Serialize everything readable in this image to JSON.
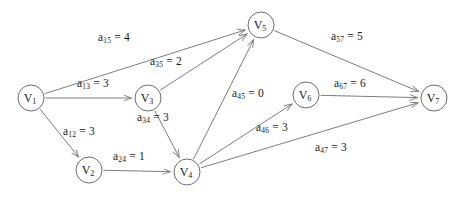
{
  "figure": {
    "background_color": "#ffffff",
    "edge_color": "#7d7d7d",
    "node_stroke_color": "#6e6e6e",
    "node_fill_color": "#ffffff",
    "text_color": "#1a1a1a"
  },
  "chart_data": {
    "type": "diagram",
    "diagram_kind": "directed-weighted-graph",
    "nodes": [
      {
        "id": "V1",
        "label_base": "V",
        "label_sub": "1",
        "x": 31,
        "y": 98,
        "r": 13
      },
      {
        "id": "V2",
        "label_base": "V",
        "label_sub": "2",
        "x": 89,
        "y": 170,
        "r": 13
      },
      {
        "id": "V3",
        "label_base": "V",
        "label_sub": "3",
        "x": 148,
        "y": 98,
        "r": 13
      },
      {
        "id": "V4",
        "label_base": "V",
        "label_sub": "4",
        "x": 187,
        "y": 172,
        "r": 13
      },
      {
        "id": "V5",
        "label_base": "V",
        "label_sub": "5",
        "x": 261,
        "y": 25,
        "r": 13
      },
      {
        "id": "V6",
        "label_base": "V",
        "label_sub": "6",
        "x": 306,
        "y": 95,
        "r": 13
      },
      {
        "id": "V7",
        "label_base": "V",
        "label_sub": "7",
        "x": 434,
        "y": 98,
        "r": 13
      }
    ],
    "edges": [
      {
        "id": "e15",
        "from": "V1",
        "to": "V5",
        "weight": 4,
        "label_base": "a",
        "label_sub": "15",
        "label_text": "a15 = 4",
        "label_x": 98,
        "label_y": 32
      },
      {
        "id": "e13",
        "from": "V1",
        "to": "V3",
        "weight": 3,
        "label_base": "a",
        "label_sub": "13",
        "label_text": "a13 = 3",
        "label_x": 77,
        "label_y": 78
      },
      {
        "id": "e12",
        "from": "V1",
        "to": "V2",
        "weight": 3,
        "label_base": "a",
        "label_sub": "12",
        "label_text": "a12 = 3",
        "label_x": 63,
        "label_y": 126
      },
      {
        "id": "e35",
        "from": "V3",
        "to": "V5",
        "weight": 2,
        "label_base": "a",
        "label_sub": "35",
        "label_text": "a35 = 2",
        "label_x": 150,
        "label_y": 56
      },
      {
        "id": "e34",
        "from": "V3",
        "to": "V4",
        "weight": 3,
        "label_base": "a",
        "label_sub": "34",
        "label_text": "a34 = 3",
        "label_x": 137,
        "label_y": 112
      },
      {
        "id": "e24",
        "from": "V2",
        "to": "V4",
        "weight": 1,
        "label_base": "a",
        "label_sub": "24",
        "label_text": "a24 = 1",
        "label_x": 113,
        "label_y": 151
      },
      {
        "id": "e45",
        "from": "V4",
        "to": "V5",
        "weight": 0,
        "label_base": "a",
        "label_sub": "45",
        "label_text": "a45 = 0",
        "label_x": 232,
        "label_y": 88
      },
      {
        "id": "e46",
        "from": "V4",
        "to": "V6",
        "weight": 3,
        "label_base": "a",
        "label_sub": "46",
        "label_text": "a46 = 3",
        "label_x": 256,
        "label_y": 122
      },
      {
        "id": "e47",
        "from": "V4",
        "to": "V7",
        "weight": 3,
        "label_base": "a",
        "label_sub": "47",
        "label_text": "a47 = 3",
        "label_x": 315,
        "label_y": 142
      },
      {
        "id": "e57",
        "from": "V5",
        "to": "V7",
        "weight": 5,
        "label_base": "a",
        "label_sub": "57",
        "label_text": "a57 = 5",
        "label_x": 331,
        "label_y": 31
      },
      {
        "id": "e67",
        "from": "V6",
        "to": "V7",
        "weight": 6,
        "label_base": "a",
        "label_sub": "67",
        "label_text": "a67 = 6",
        "label_x": 334,
        "label_y": 78
      }
    ]
  }
}
